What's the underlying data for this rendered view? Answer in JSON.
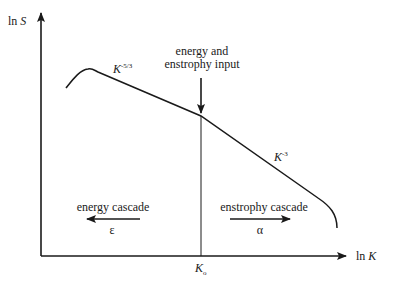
{
  "diagram": {
    "y_axis": {
      "prefix": "ln",
      "var": "S"
    },
    "x_axis": {
      "prefix": "ln",
      "var": "K"
    },
    "k0_label": {
      "var": "K",
      "sub": "o"
    },
    "input_label": [
      "energy and",
      "enstrophy input"
    ],
    "slope_left": {
      "var": "K",
      "exp": "-5/3"
    },
    "slope_right": {
      "var": "K",
      "exp": "-3"
    },
    "energy_cascade": {
      "label": "energy cascade",
      "symbol": "ε",
      "direction": "left"
    },
    "enstrophy_cascade": {
      "label": "enstrophy cascade",
      "symbol": "α",
      "direction": "right"
    },
    "line_color": "#1a1a1a"
  }
}
